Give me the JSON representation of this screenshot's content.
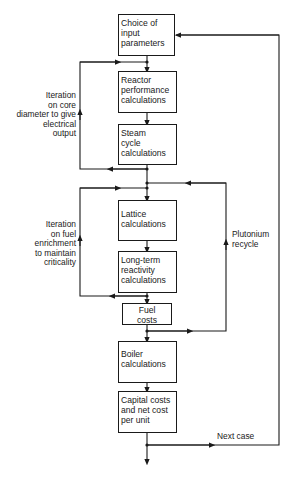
{
  "diagram": {
    "type": "flowchart",
    "boxes": [
      {
        "id": "input",
        "label": "Choice of\ninput\nparameters"
      },
      {
        "id": "reactor",
        "label": "Reactor\nperformance\ncalculations"
      },
      {
        "id": "steam",
        "label": "Steam\ncycle\ncalculations"
      },
      {
        "id": "lattice",
        "label": "Lattice\ncalculations"
      },
      {
        "id": "longterm",
        "label": "Long-term\nreactivity\ncalculations"
      },
      {
        "id": "fuel",
        "label": "Fuel\ncosts"
      },
      {
        "id": "boiler",
        "label": "Boiler\ncalculations"
      },
      {
        "id": "capital",
        "label": "Capital costs\nand net cost\nper unit"
      }
    ],
    "loops": [
      {
        "id": "core-iteration",
        "label": "Iteration\non core\ndiameter to give\nelectrical\noutput",
        "from": "steam",
        "to": "reactor"
      },
      {
        "id": "enrichment-iteration",
        "label": "Iteration\non fuel\nenrichment\nto maintain\ncriticality",
        "from": "longterm",
        "to": "lattice"
      },
      {
        "id": "plutonium-recycle",
        "label": "Plutonium\nrecycle",
        "from": "fuel",
        "to": "lattice"
      },
      {
        "id": "next-case",
        "label": "Next case",
        "from": "capital",
        "to": "input"
      }
    ],
    "line_color": "#1a1a1a"
  }
}
